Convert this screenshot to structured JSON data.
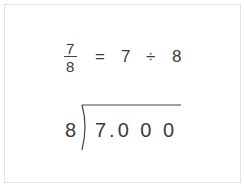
{
  "equation": {
    "fraction": {
      "numerator": "7",
      "denominator": "8"
    },
    "equals": "=",
    "dividend": "7",
    "divide_sign": "÷",
    "divisor": "8"
  },
  "long_division": {
    "divisor": "8",
    "dividend": "7.0 0 0"
  },
  "colors": {
    "text": "#3a3a3a",
    "border": "#e2e2e2",
    "background": "#ffffff"
  }
}
